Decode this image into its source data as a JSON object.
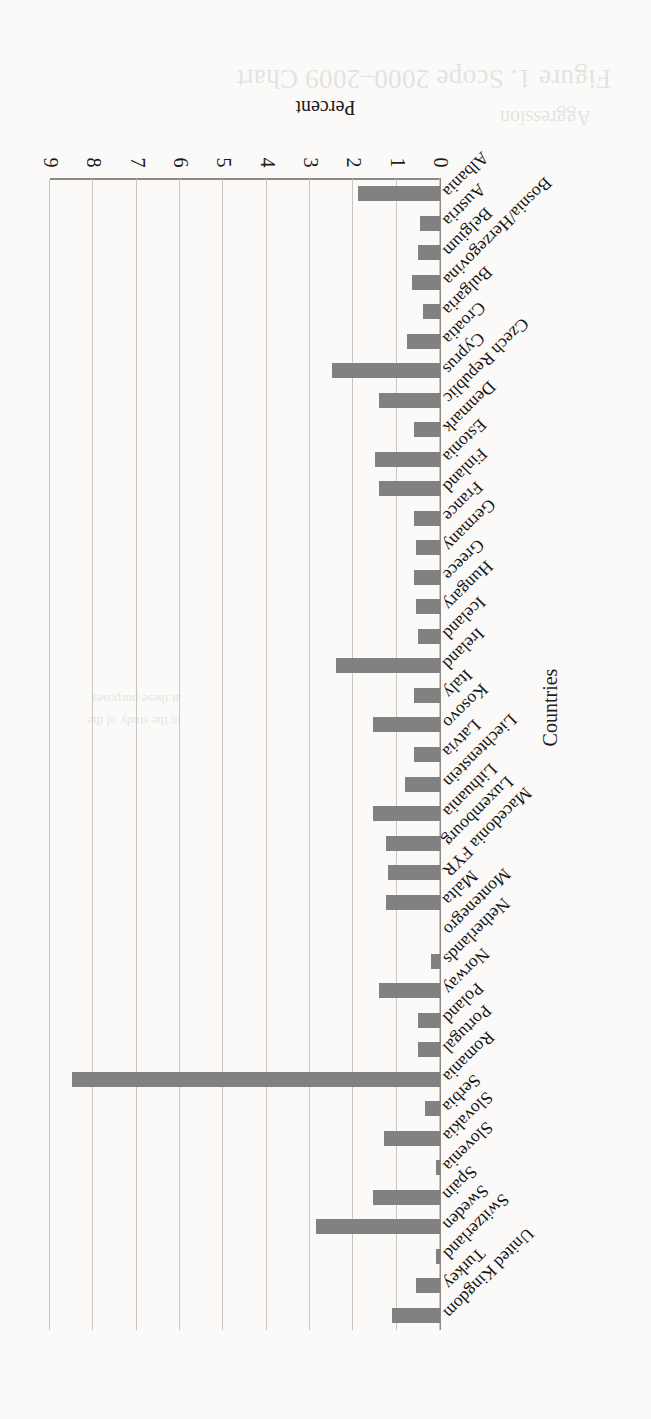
{
  "chart_data": {
    "type": "bar",
    "orientation": "vertical-bars-rotated-180",
    "title": "",
    "xlabel": "Countries",
    "ylabel": "Percent",
    "ylim": [
      0,
      9
    ],
    "yticks": [
      0,
      1,
      2,
      3,
      4,
      5,
      6,
      7,
      8,
      9
    ],
    "grid": true,
    "legend": "none",
    "bar_color": "#818181",
    "categories": [
      "Albania",
      "Austria",
      "Belgium",
      "Bosnia/Herzegovina",
      "Bulgaria",
      "Croatia",
      "Cyprus",
      "Czech Republic",
      "Denmark",
      "Estonia",
      "Finland",
      "France",
      "Germany",
      "Greece",
      "Hungary",
      "Iceland",
      "Ireland",
      "Italy",
      "Kosovo",
      "Latvia",
      "Liechtenstein",
      "Lithuania",
      "Luxembourg",
      "Macedonia FYR",
      "Malta",
      "Montenegro",
      "Netherlands",
      "Norway",
      "Poland",
      "Portugal",
      "Romania",
      "Serbia",
      "Slovakia",
      "Slovenia",
      "Spain",
      "Sweden",
      "Switzerland",
      "Turkey",
      "United Kingdom"
    ],
    "values": [
      1.9,
      0.45,
      0.5,
      0.65,
      0.4,
      0.75,
      2.5,
      1.4,
      0.6,
      1.5,
      1.4,
      0.6,
      0.55,
      0.6,
      0.55,
      0.5,
      2.4,
      0.6,
      1.55,
      0.6,
      0.8,
      1.55,
      1.25,
      1.2,
      1.25,
      0.0,
      0.2,
      1.4,
      0.5,
      0.5,
      8.5,
      0.35,
      1.3,
      0.1,
      1.55,
      2.85,
      0.1,
      0.55,
      1.1
    ]
  },
  "ghost": {
    "title": "Figure 1. Scope 2000–2009 Chart",
    "subtitle": "Aggression",
    "lines": [
      "in the study of the",
      "at these purposes"
    ]
  }
}
